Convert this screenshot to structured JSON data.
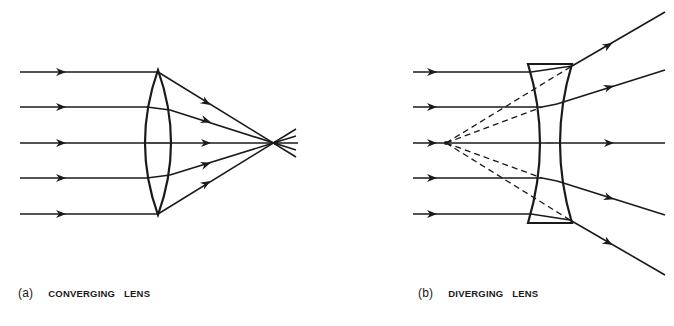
{
  "figure": {
    "panels": [
      {
        "id": "a",
        "tag": "(a)",
        "label": "CONVERGING LENS",
        "lens_type": "biconvex",
        "lens": {
          "cx": 158,
          "top": 70,
          "bottom": 215,
          "half_width": 15
        },
        "focal_point": {
          "x": 276,
          "y": 143
        },
        "ray_y": [
          72,
          107,
          143,
          178,
          214
        ],
        "ray_start_x": 20,
        "incoming_arrow_x": 63
      },
      {
        "id": "b",
        "tag": "(b)",
        "label": "DIVERGING LENS",
        "lens_type": "biconcave",
        "lens": {
          "left": 528,
          "right": 572,
          "top": 64,
          "bottom": 223
        },
        "virtual_focal_point": {
          "x": 446,
          "y": 143
        },
        "ray_y": [
          72,
          107,
          143,
          178,
          214
        ],
        "ray_start_x": 413,
        "incoming_arrow_x": 433,
        "exit_points": [
          [
            665,
            12
          ],
          [
            665,
            70
          ],
          [
            665,
            143
          ],
          [
            665,
            215
          ],
          [
            665,
            275
          ]
        ],
        "virtual_rays_dashed": true
      }
    ],
    "colors": {
      "ink": "#1a1a1a",
      "background": "#ffffff"
    }
  }
}
